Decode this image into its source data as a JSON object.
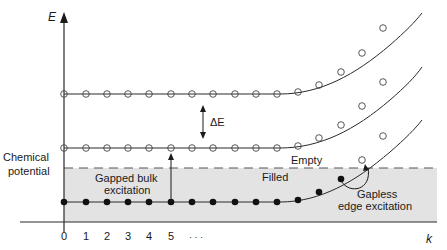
{
  "diagram": {
    "axis_labels": {
      "y": "E",
      "x": "k"
    },
    "x_ticks": [
      "0",
      "1",
      "2",
      "3",
      "4",
      "5",
      "· · ·"
    ],
    "labels": {
      "chemical_potential_line1": "Chemical",
      "chemical_potential_line2": "potential",
      "delta_e": "ΔE",
      "gapped_line1": "Gapped bulk",
      "gapped_line2": "excitation",
      "empty": "Empty",
      "filled": "Filled",
      "gapless_line1": "Gapless",
      "gapless_line2": "edge excitation"
    },
    "bands": [
      {
        "name": "upper-band",
        "marker": "open-circle"
      },
      {
        "name": "middle-band",
        "marker": "open-circle"
      },
      {
        "name": "lower-band",
        "marker": "filled-circle"
      }
    ],
    "colors": {
      "line": "#2a2a2a",
      "filled_region": "#e3e3e3",
      "text": "#1a1a1a"
    }
  }
}
